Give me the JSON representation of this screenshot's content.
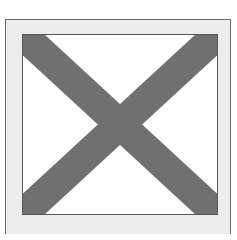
{
  "image": {
    "description": "Placeholder image icon: grey X crossing a white box inside a light grey frame",
    "icon": "broken-image-placeholder-icon"
  },
  "colors": {
    "background": "#ffffff",
    "frame_fill": "#ececec",
    "frame_border": "#6a6a6a",
    "inner_fill": "#ffffff",
    "inner_border": "#555555",
    "cross": "#707070"
  }
}
